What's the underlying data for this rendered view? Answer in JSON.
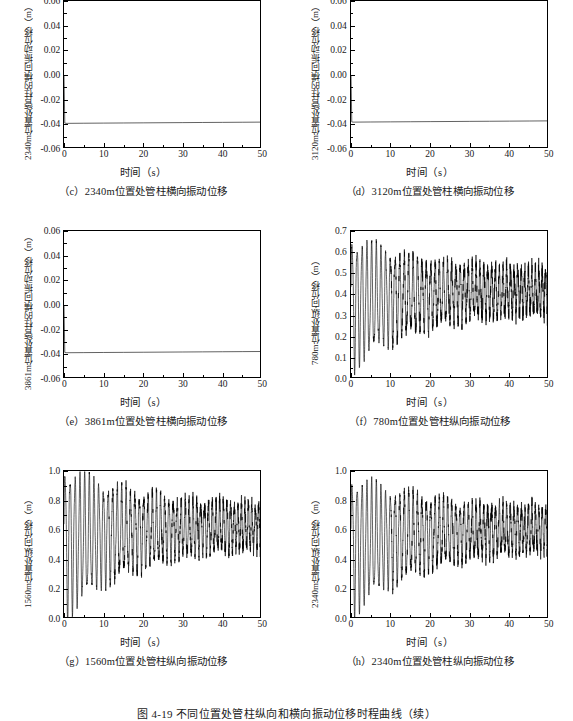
{
  "figure": {
    "caption": "图 4-19   不同位置处管柱纵向和横向振动位移时程曲线（续）"
  },
  "common": {
    "xlabel": "时间（s）",
    "unit_m": "（m）"
  },
  "chart_data": [
    {
      "id": "c",
      "type": "line",
      "title": "（c）2340m位置处管柱横向振动位移",
      "ylabel": "2340m位置处管柱的横向振动位移（m）",
      "xlabel": "时间（s）",
      "xlim": [
        0,
        50
      ],
      "ylim": [
        -0.06,
        0.06
      ],
      "xticks": [
        0,
        10,
        20,
        30,
        40,
        50
      ],
      "yticks": [
        -0.06,
        -0.04,
        -0.02,
        0.0,
        0.02,
        0.04,
        0.06
      ],
      "ytick_labels": [
        "-0.06",
        "-0.04",
        "-0.02",
        "0.00",
        "0.02",
        "0.04",
        "0.06"
      ],
      "grid": false,
      "legend": "none",
      "series": [
        {
          "name": "2340m横向位移",
          "x": [
            0,
            0.2,
            0.5,
            1,
            5,
            10,
            15,
            20,
            25,
            30,
            35,
            40,
            45,
            50
          ],
          "values": [
            -0.0005,
            -0.039,
            -0.0392,
            -0.0392,
            -0.0391,
            -0.039,
            -0.0389,
            -0.0388,
            -0.0387,
            -0.0386,
            -0.0385,
            -0.0384,
            -0.0383,
            -0.0382
          ]
        }
      ]
    },
    {
      "id": "d",
      "type": "line",
      "title": "（d）3120m位置处管柱横向振动位移",
      "ylabel": "3120m位置处管柱的横向振动位移（m）",
      "xlabel": "时间（s）",
      "xlim": [
        0,
        50
      ],
      "ylim": [
        -0.06,
        0.06
      ],
      "xticks": [
        0,
        10,
        20,
        30,
        40,
        50
      ],
      "yticks": [
        -0.06,
        -0.04,
        -0.02,
        0.0,
        0.02,
        0.04,
        0.06
      ],
      "ytick_labels": [
        "-0.06",
        "-0.04",
        "-0.02",
        "0.00",
        "0.02",
        "0.04",
        "0.06"
      ],
      "grid": false,
      "legend": "none",
      "series": [
        {
          "name": "3120m横向位移",
          "x": [
            0,
            0.2,
            0.5,
            1,
            5,
            10,
            15,
            20,
            25,
            30,
            35,
            40,
            45,
            50
          ],
          "values": [
            0.0,
            -0.038,
            -0.0382,
            -0.0382,
            -0.0381,
            -0.038,
            -0.0379,
            -0.0378,
            -0.0377,
            -0.0376,
            -0.0375,
            -0.0374,
            -0.0373,
            -0.0372
          ]
        }
      ]
    },
    {
      "id": "e",
      "type": "line",
      "title": "（e）3861m位置处管柱横向振动位移",
      "ylabel": "3861m位置处管柱的横向振动位移（m）",
      "xlabel": "时间（s）",
      "xlim": [
        0,
        50
      ],
      "ylim": [
        -0.06,
        0.06
      ],
      "xticks": [
        0,
        10,
        20,
        30,
        40,
        50
      ],
      "yticks": [
        -0.06,
        -0.04,
        -0.02,
        0.0,
        0.02,
        0.04,
        0.06
      ],
      "ytick_labels": [
        "-0.06",
        "-0.04",
        "-0.02",
        "0.00",
        "0.02",
        "0.04",
        "0.06"
      ],
      "grid": false,
      "legend": "none",
      "series": [
        {
          "name": "3861m横向位移",
          "x": [
            0,
            0.2,
            0.5,
            1,
            5,
            10,
            15,
            20,
            25,
            30,
            35,
            40,
            45,
            50
          ],
          "values": [
            0.0,
            -0.0385,
            -0.0387,
            -0.0387,
            -0.0386,
            -0.0385,
            -0.0384,
            -0.0383,
            -0.0382,
            -0.0381,
            -0.038,
            -0.0379,
            -0.0378,
            -0.0377
          ]
        }
      ]
    },
    {
      "id": "f",
      "type": "line",
      "title": "（f）780m位置处管柱纵向振动位移",
      "ylabel": "780m位置处纵向位移（m）",
      "xlabel": "时间（s）",
      "xlim": [
        0,
        50
      ],
      "ylim": [
        0.0,
        0.7
      ],
      "xticks": [
        0,
        10,
        20,
        30,
        40,
        50
      ],
      "yticks": [
        0.0,
        0.1,
        0.2,
        0.3,
        0.4,
        0.5,
        0.6,
        0.7
      ],
      "ytick_labels": [
        "0.0",
        "0.1",
        "0.2",
        "0.3",
        "0.4",
        "0.5",
        "0.6",
        "0.7"
      ],
      "grid": false,
      "legend": "none",
      "description": "阻尼振荡，初期振幅 0.05~0.66，约 12s 后衰减至 0.28~0.55，均值约 0.42",
      "oscillation": {
        "mean_start": 0.36,
        "mean_end": 0.42,
        "amp_start": 0.3,
        "amp_end": 0.09,
        "period_start": 1.25,
        "period_end": 0.85,
        "noise": 0.035
      }
    },
    {
      "id": "g",
      "type": "line",
      "title": "（g）1560m位置处管柱纵向振动位移",
      "ylabel": "1560m位置处纵向位移（m）",
      "xlabel": "时间（s）",
      "xlim": [
        0,
        50
      ],
      "ylim": [
        0.0,
        1.0
      ],
      "xticks": [
        0,
        10,
        20,
        30,
        40,
        50
      ],
      "yticks": [
        0.0,
        0.2,
        0.4,
        0.6,
        0.8,
        1.0
      ],
      "ytick_labels": [
        "0.0",
        "0.2",
        "0.4",
        "0.6",
        "0.8",
        "1.0"
      ],
      "grid": false,
      "legend": "none",
      "description": "阻尼振荡，初期振幅 0.03~1.0，约 12s 后衰减至 0.48~0.80，均值约 0.63",
      "oscillation": {
        "mean_start": 0.52,
        "mean_end": 0.63,
        "amp_start": 0.49,
        "amp_end": 0.13,
        "period_start": 1.25,
        "period_end": 0.85,
        "noise": 0.04
      }
    },
    {
      "id": "h",
      "type": "line",
      "title": "（h）2340m位置处管柱纵向振动位移",
      "ylabel": "2340m位置处纵向位移（m）",
      "xlabel": "时间（s）",
      "xlim": [
        0,
        50
      ],
      "ylim": [
        0.0,
        1.0
      ],
      "xticks": [
        0,
        10,
        20,
        30,
        40,
        50
      ],
      "yticks": [
        0.0,
        0.2,
        0.4,
        0.6,
        0.8,
        1.0
      ],
      "ytick_labels": [
        "0.0",
        "0.2",
        "0.4",
        "0.6",
        "0.8",
        "1.0"
      ],
      "grid": false,
      "legend": "none",
      "description": "阻尼振荡，初期振幅 0.02~0.93，约 12s 后衰减至 0.45~0.78，均值约 0.61",
      "oscillation": {
        "mean_start": 0.5,
        "mean_end": 0.61,
        "amp_start": 0.45,
        "amp_end": 0.13,
        "period_start": 1.25,
        "period_end": 0.85,
        "noise": 0.04
      }
    }
  ]
}
